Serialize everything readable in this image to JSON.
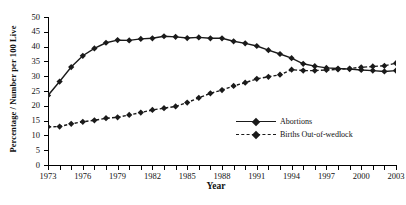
{
  "chart_data": {
    "type": "line",
    "title": "",
    "xlabel": "Year",
    "ylabel": "Percentage / Number per 100 Live",
    "xlim": [
      1973,
      2003
    ],
    "ylim": [
      0,
      50
    ],
    "ytick_step": 5,
    "xtick_step": 1,
    "xtick_label_step": 3,
    "grid": false,
    "legend_position": "inside-right",
    "ytick_labels": [
      "0",
      "5",
      "10",
      "15",
      "20",
      "25",
      "30",
      "35",
      "40",
      "45",
      "50"
    ],
    "xtick_labels": [
      "1973",
      "1976",
      "1979",
      "1982",
      "1985",
      "1988",
      "1991",
      "1994",
      "1997",
      "2000",
      "2003"
    ],
    "x": [
      1973,
      1974,
      1975,
      1976,
      1977,
      1978,
      1979,
      1980,
      1981,
      1982,
      1983,
      1984,
      1985,
      1986,
      1987,
      1988,
      1989,
      1990,
      1991,
      1992,
      1993,
      1994,
      1995,
      1996,
      1997,
      1998,
      1999,
      2000,
      2001,
      2002,
      2003
    ],
    "series": [
      {
        "name": "Abortions",
        "style": "solid",
        "marker": "diamond",
        "color": "#1a1a1a",
        "values": [
          23.5,
          28.2,
          33.1,
          36.9,
          39.4,
          41.3,
          42.2,
          42.1,
          42.6,
          42.8,
          43.5,
          43.3,
          42.9,
          43.1,
          42.8,
          42.8,
          41.8,
          41.1,
          40.2,
          38.8,
          37.5,
          36.1,
          34.2,
          33.4,
          32.8,
          32.6,
          32.4,
          32.1,
          31.9,
          31.6,
          31.9
        ]
      },
      {
        "name": "Births Out-of-wedlock",
        "style": "dashed",
        "marker": "diamond",
        "color": "#1a1a1a",
        "values": [
          12.9,
          13.0,
          13.9,
          14.6,
          15.1,
          15.8,
          16.1,
          16.9,
          17.7,
          18.6,
          19.2,
          19.8,
          21.1,
          22.7,
          24.2,
          25.3,
          26.7,
          27.8,
          29.1,
          29.8,
          30.5,
          32.2,
          31.9,
          31.9,
          32.1,
          32.3,
          32.6,
          33.0,
          33.3,
          33.5,
          34.4
        ]
      }
    ]
  }
}
